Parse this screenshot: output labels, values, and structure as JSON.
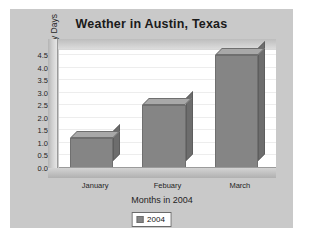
{
  "chart_data": {
    "type": "bar",
    "title": "Weather in Austin, Texas",
    "xlabel": "Months in 2004",
    "ylabel": "Number of Sunny Days",
    "categories": [
      "January",
      "Febuary",
      "March"
    ],
    "values": [
      1.2,
      2.5,
      4.5
    ],
    "series": [
      {
        "name": "2004",
        "values": [
          1.2,
          2.5,
          4.5
        ]
      }
    ],
    "ylim": [
      0.0,
      4.75
    ],
    "yticks": [
      "0.0",
      "0.5",
      "1.0",
      "1.5",
      "2.0",
      "2.5",
      "3.0",
      "3.5",
      "4.0",
      "4.5"
    ],
    "ytick_values": [
      0.0,
      0.5,
      1.0,
      1.5,
      2.0,
      2.5,
      3.0,
      3.5,
      4.0,
      4.5
    ],
    "grid": true,
    "legend": {
      "position": "bottom",
      "entries": [
        "2004"
      ]
    },
    "style": "3d",
    "colors": {
      "bar_front": "#858585",
      "bar_top": "#a8a8a8",
      "bar_side": "#6d6d6d",
      "panel_background": "#c9c9c9",
      "plot_background": "#ffffff",
      "gridline": "#ededed",
      "text": "#1f1f1f"
    }
  }
}
